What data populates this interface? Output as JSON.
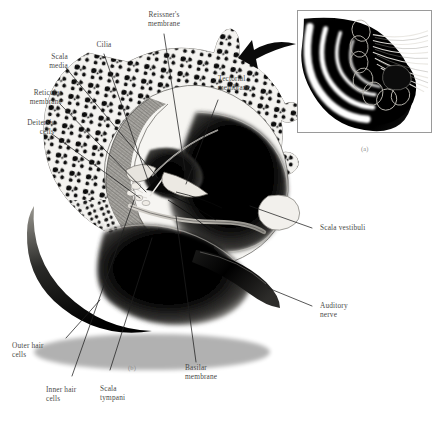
{
  "figure": {
    "panels": [
      {
        "id": "a",
        "tag": "(a)",
        "caption": "(a)"
      },
      {
        "id": "b",
        "tag": "(b)",
        "caption": "(b)"
      }
    ]
  },
  "labels": [
    {
      "id": "reissners-membrane",
      "text": "Reissner's\nmembrane",
      "align": "center"
    },
    {
      "id": "cilia",
      "text": "Cilia",
      "align": "center"
    },
    {
      "id": "scala-media",
      "text": "Scala\nmedia",
      "align": "right"
    },
    {
      "id": "reticular-membrane",
      "text": "Reticular\nmembrane",
      "align": "right"
    },
    {
      "id": "deiterss-cells",
      "text": "Deiters's\ncells",
      "align": "right"
    },
    {
      "id": "tectorial-membrane",
      "text": "Tectorial\nmembrane",
      "align": "left"
    },
    {
      "id": "scala-vestibuli",
      "text": "Scala vestibuli",
      "align": "left"
    },
    {
      "id": "auditory-nerve",
      "text": "Auditory\nnerve",
      "align": "left"
    },
    {
      "id": "basilar-membrane",
      "text": "Basilar\nmembrane",
      "align": "left"
    },
    {
      "id": "scala-tympani",
      "text": "Scala\ntympani",
      "align": "left"
    },
    {
      "id": "inner-hair-cells",
      "text": "Inner hair\ncells",
      "align": "left"
    },
    {
      "id": "outer-hair-cells",
      "text": "Outer hair\ncells",
      "align": "left"
    }
  ],
  "panel_tags": {
    "a": "(a)",
    "b": "(b)"
  },
  "colors": {
    "ink": "#4a4a48",
    "leader_line": "#2b2b2b",
    "panel_tag": "#8d8d8d",
    "inset_border": "#9a9a9a",
    "bone_fill": "#f2f1ee",
    "bone_speckle": "#0d0d0d",
    "fluid_dark": "#000000",
    "tissue_mid": "#7d7b77",
    "background": "#ffffff"
  }
}
